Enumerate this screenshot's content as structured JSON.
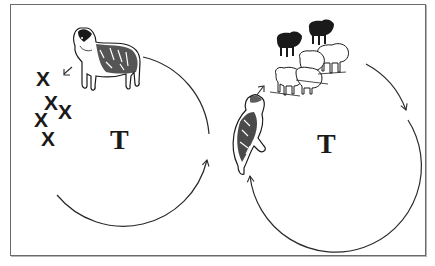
{
  "diagram": {
    "panels": [
      {
        "id": "left",
        "center_label": "T",
        "figure": "standing-dog",
        "markers": [
          "X",
          "X",
          "X",
          "X",
          "X"
        ],
        "small_arrow": "pointing toward X markers"
      },
      {
        "id": "right",
        "center_label": "T",
        "figure": "rearing-dog",
        "flock": {
          "black_sheep": 2,
          "white_sheep": 4
        },
        "small_arrow": "pointing toward flock"
      }
    ],
    "colors": {
      "line": "#2a2a2a",
      "frame": "#6a6a6a",
      "background": "#ffffff"
    }
  }
}
